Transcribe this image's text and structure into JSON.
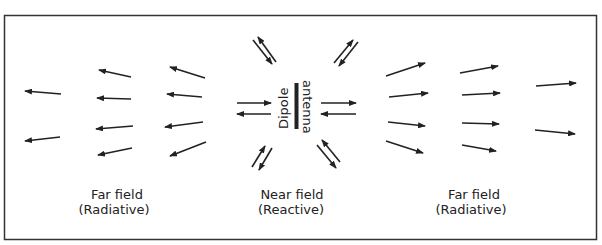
{
  "diagram": {
    "antenna_label_1": "Dipole",
    "antenna_label_2": "antenna",
    "regions": [
      {
        "label_1": "Far field",
        "label_2": "(Radiative)",
        "side": "left"
      },
      {
        "label_1": "Near field",
        "label_2": "(Reactive)",
        "side": "center"
      },
      {
        "label_1": "Far field",
        "label_2": "(Radiative)",
        "side": "right"
      }
    ],
    "colors": {
      "ink": "#222222",
      "border": "#333333",
      "background": "#ffffff"
    }
  },
  "arrows": {
    "left_far": [
      [
        61,
        94,
        25,
        91
      ],
      [
        60,
        137,
        25,
        141
      ],
      [
        131,
        77,
        99,
        70
      ],
      [
        131,
        99,
        97,
        98
      ],
      [
        133,
        126,
        96,
        129
      ],
      [
        132,
        148,
        98,
        155
      ],
      [
        205,
        78,
        170,
        67
      ],
      [
        202,
        97,
        167,
        94
      ],
      [
        203,
        122,
        165,
        127
      ],
      [
        206,
        142,
        170,
        156
      ]
    ],
    "right_far": [
      [
        386,
        76,
        425,
        63
      ],
      [
        389,
        97,
        428,
        93
      ],
      [
        388,
        122,
        425,
        126
      ],
      [
        386,
        141,
        423,
        153
      ],
      [
        460,
        73,
        498,
        66
      ],
      [
        462,
        95,
        500,
        93
      ],
      [
        462,
        123,
        499,
        124
      ],
      [
        462,
        145,
        496,
        151
      ],
      [
        536,
        86,
        576,
        83
      ],
      [
        535,
        130,
        575,
        134
      ]
    ],
    "near": [
      [
        253,
        40,
        272,
        64
      ],
      [
        276,
        62,
        258,
        37
      ],
      [
        334,
        63,
        353,
        40
      ],
      [
        358,
        42,
        339,
        66
      ],
      [
        237,
        103,
        271,
        103
      ],
      [
        271,
        114,
        237,
        114
      ],
      [
        321,
        103,
        356,
        103
      ],
      [
        356,
        114,
        321,
        114
      ],
      [
        252,
        167,
        265,
        146
      ],
      [
        272,
        148,
        259,
        170
      ],
      [
        317,
        145,
        336,
        168
      ],
      [
        340,
        162,
        322,
        140
      ]
    ]
  }
}
